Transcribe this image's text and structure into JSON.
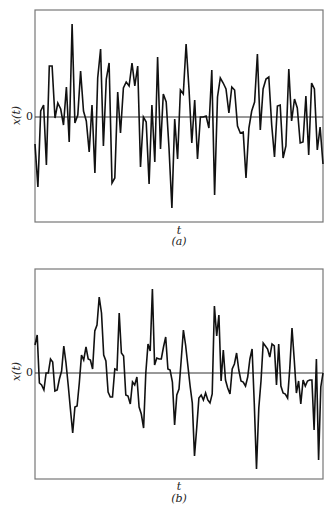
{
  "chart_data": [
    {
      "type": "line",
      "panel": "(a)",
      "title": "",
      "xlabel": "t",
      "ylabel": "x(t)",
      "caption": "(a)",
      "yticks": [
        "0"
      ],
      "grid": false,
      "legend": null,
      "description": "Rapidly fluctuating random signal about zero (wideband)",
      "frame": {
        "left": 35,
        "top": 10,
        "right": 323,
        "bottom": 222,
        "zero_y": 117
      },
      "x": [
        0,
        1,
        2,
        3,
        4,
        5,
        6,
        7,
        8,
        9,
        10,
        11,
        12,
        13,
        14,
        15,
        16,
        17,
        18,
        19,
        20,
        21,
        22,
        23,
        24,
        25,
        26,
        27,
        28,
        29,
        30,
        31,
        32,
        33,
        34,
        35,
        36,
        37,
        38,
        39,
        40,
        41,
        42,
        43,
        44,
        45,
        46,
        47,
        48,
        49,
        50,
        51,
        52,
        53,
        54,
        55,
        56,
        57,
        58,
        59,
        60,
        61,
        62,
        63,
        64,
        65,
        66,
        67,
        68,
        69,
        70,
        71,
        72,
        73,
        74,
        75,
        76,
        77,
        78,
        79,
        80,
        81,
        82,
        83,
        84,
        85,
        86,
        87,
        88,
        89,
        90,
        91,
        92,
        93,
        94,
        95,
        96,
        97,
        98,
        99,
        100,
        101,
        102,
        103,
        104,
        105,
        106,
        107,
        108,
        109,
        110,
        111,
        112,
        113,
        114,
        115,
        116,
        117,
        118,
        119,
        120,
        121,
        122,
        123,
        124,
        125,
        126,
        127,
        128,
        129,
        130,
        131,
        132,
        133,
        134,
        135,
        136,
        137,
        138,
        139,
        140,
        141,
        142,
        143
      ],
      "values": [
        -27,
        -70,
        6,
        12,
        -48,
        51,
        51,
        -1,
        14,
        8,
        -8,
        30,
        -25,
        93,
        -6,
        2,
        46,
        6,
        -4,
        -35,
        12,
        -56,
        39,
        68,
        -29,
        38,
        54,
        -66,
        -61,
        25,
        -16,
        29,
        35,
        31,
        54,
        31,
        51,
        -50,
        0,
        -5,
        -67,
        12,
        -45,
        60,
        -32,
        23,
        15,
        -31,
        -91,
        -2,
        -42,
        27,
        23,
        73,
        28,
        -26,
        17,
        -42,
        0,
        0,
        1,
        -11,
        47,
        -78,
        20,
        39,
        34,
        28,
        4,
        30,
        27,
        -9,
        -16,
        -15,
        -61,
        -11,
        6,
        15,
        63,
        -13,
        28,
        38,
        40,
        -8,
        -40,
        11,
        12,
        -41,
        -29,
        48,
        -4,
        18,
        9,
        -26,
        -25,
        21,
        -38,
        34,
        28,
        -33,
        -10,
        -47
      ],
      "ylim": [
        -105,
        105
      ]
    },
    {
      "type": "line",
      "panel": "(b)",
      "title": "",
      "xlabel": "t",
      "ylabel": "x(t)",
      "caption": "(b)",
      "yticks": [
        "0"
      ],
      "grid": false,
      "legend": null,
      "description": "Smoother, lower-frequency random signal about zero (narrowband)",
      "frame": {
        "left": 35,
        "top": 269,
        "right": 323,
        "bottom": 479,
        "zero_y": 373
      },
      "values": [
        28,
        38,
        -10,
        -12,
        -17,
        0,
        0,
        14,
        11,
        -18,
        -17,
        -6,
        2,
        27,
        10,
        -12,
        -36,
        -60,
        -34,
        -33,
        -10,
        18,
        13,
        26,
        14,
        13,
        4,
        42,
        48,
        76,
        60,
        18,
        12,
        -19,
        -24,
        -24,
        4,
        3,
        60,
        20,
        17,
        -22,
        -23,
        -31,
        -9,
        -12,
        -4,
        -34,
        -41,
        -55,
        0,
        29,
        22,
        84,
        8,
        15,
        14,
        14,
        26,
        36,
        4,
        3,
        -9,
        -52,
        -22,
        -16,
        13,
        43,
        28,
        7,
        -13,
        -30,
        -83,
        -55,
        -25,
        -22,
        -27,
        -20,
        -27,
        -30,
        -21,
        67,
        37,
        58,
        -8,
        23,
        -7,
        -15,
        -21,
        4,
        9,
        20,
        3,
        -8,
        -9,
        -13,
        -4,
        14,
        24,
        -31,
        -96,
        -35,
        -8,
        30,
        27,
        24,
        16,
        29,
        27,
        -12,
        29,
        -13,
        -20,
        -21,
        -25,
        5,
        45,
        14,
        -20,
        -8,
        -31,
        -7,
        -13,
        -8,
        -7,
        -7,
        -57,
        14,
        -87,
        -14,
        0
      ],
      "ylim": [
        -105,
        105
      ]
    }
  ],
  "labels": {
    "a": {
      "ylabel": "x(t)",
      "zero": "0",
      "xlabel": "t",
      "caption": "(a)"
    },
    "b": {
      "ylabel": "x(t)",
      "zero": "0",
      "xlabel": "t",
      "caption": "(b)"
    }
  },
  "colors": {
    "line": "#111111",
    "frame": "#777777",
    "zero_line": "#333333",
    "background": "#ffffff"
  }
}
